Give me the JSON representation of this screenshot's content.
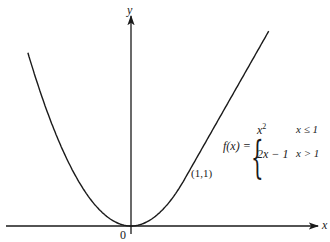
{
  "chart_data": {
    "type": "line",
    "title": "",
    "xlabel": "x",
    "ylabel": "y",
    "origin_label": "0",
    "series": [
      {
        "name": "f(x)",
        "definition": [
          {
            "expr": "x^2",
            "condition": "x ≤ 1"
          },
          {
            "expr": "2x − 1",
            "condition": "x > 1"
          }
        ],
        "points": [
          {
            "x": -2.0,
            "y": 4.0
          },
          {
            "x": -1.5,
            "y": 2.25
          },
          {
            "x": -1.0,
            "y": 1.0
          },
          {
            "x": -0.5,
            "y": 0.25
          },
          {
            "x": 0.0,
            "y": 0.0
          },
          {
            "x": 0.5,
            "y": 0.25
          },
          {
            "x": 1.0,
            "y": 1.0
          },
          {
            "x": 1.5,
            "y": 2.0
          },
          {
            "x": 2.0,
            "y": 3.0
          },
          {
            "x": 2.5,
            "y": 4.0
          }
        ]
      }
    ],
    "annotations": [
      {
        "text": "(1,1)",
        "x": 1,
        "y": 1
      }
    ],
    "grid": false,
    "legend": "none"
  },
  "labels": {
    "y_axis": "y",
    "x_axis": "x",
    "origin": "0",
    "point": "(1,1)",
    "func_name": "f",
    "func_lhs": "f(x) =",
    "case1_expr": "x",
    "case1_exp": "2",
    "case1_cond": "x ≤ 1",
    "case2_expr": "2x − 1",
    "case2_cond": "x > 1",
    "brace": "{"
  },
  "colors": {
    "ink": "#1a1a1a",
    "background": "#ffffff"
  }
}
